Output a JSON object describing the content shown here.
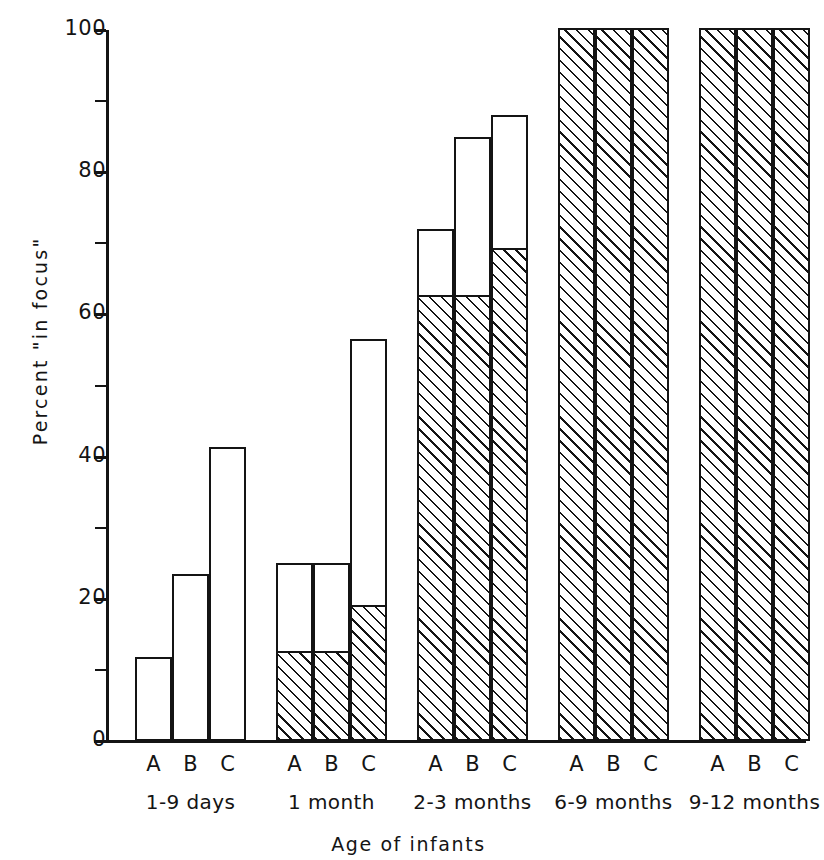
{
  "chart_data": {
    "type": "bar",
    "title": "",
    "subtitle": "",
    "xlabel": "Age of infants",
    "ylabel": "Percent \"in focus\"",
    "ylim": [
      0,
      100
    ],
    "grid": false,
    "legend": "none",
    "ytick_labels": [
      "0",
      "20",
      "40",
      "60",
      "80",
      "100"
    ],
    "ytick_values": [
      0,
      20,
      40,
      60,
      80,
      100
    ],
    "yminor_values": [
      10,
      30,
      50,
      70,
      90
    ],
    "categories": [
      "A",
      "B",
      "C"
    ],
    "groups": [
      "1-9 days",
      "1 month",
      "2-3 months",
      "6-9 months",
      "9-12 months"
    ],
    "series": [
      {
        "name": "Total percent in focus",
        "style": "open-outline"
      },
      {
        "name": "Hatched lower portion",
        "style": "diagonal-hatch"
      }
    ],
    "bars": [
      {
        "group": "1-9 days",
        "category": "A",
        "total": 11.8,
        "hatched": 0
      },
      {
        "group": "1-9 days",
        "category": "B",
        "total": 23.5,
        "hatched": 0
      },
      {
        "group": "1-9 days",
        "category": "C",
        "total": 41.3,
        "hatched": 0
      },
      {
        "group": "1 month",
        "category": "A",
        "total": 25.0,
        "hatched": 12.4
      },
      {
        "group": "1 month",
        "category": "B",
        "total": 25.0,
        "hatched": 12.4
      },
      {
        "group": "1 month",
        "category": "C",
        "total": 56.5,
        "hatched": 18.9
      },
      {
        "group": "2-3 months",
        "category": "A",
        "total": 72.0,
        "hatched": 62.5
      },
      {
        "group": "2-3 months",
        "category": "B",
        "total": 85.0,
        "hatched": 62.5
      },
      {
        "group": "2-3 months",
        "category": "C",
        "total": 88.0,
        "hatched": 69.0
      },
      {
        "group": "6-9 months",
        "category": "A",
        "total": 100.0,
        "hatched": 100.0
      },
      {
        "group": "6-9 months",
        "category": "B",
        "total": 100.0,
        "hatched": 100.0
      },
      {
        "group": "6-9 months",
        "category": "C",
        "total": 100.0,
        "hatched": 100.0
      },
      {
        "group": "9-12 months",
        "category": "A",
        "total": 100.0,
        "hatched": 100.0
      },
      {
        "group": "9-12 months",
        "category": "B",
        "total": 100.0,
        "hatched": 100.0
      },
      {
        "group": "9-12 months",
        "category": "C",
        "total": 100.0,
        "hatched": 100.0
      }
    ],
    "colors": {
      "ink": "#141414",
      "background": "#ffffff",
      "bar_fill": "#ffffff",
      "hatch_line": "#141414"
    }
  },
  "axis": {
    "y_label": "Percent \"in focus\"",
    "x_title": "Age of infants"
  }
}
